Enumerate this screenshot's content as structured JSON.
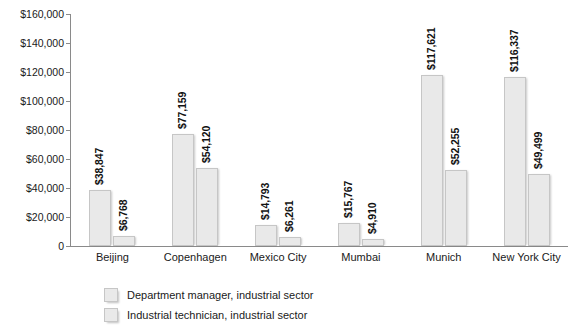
{
  "chart_data": {
    "type": "bar",
    "title": "",
    "xlabel": "",
    "ylabel": "",
    "categories": [
      "Beijing",
      "Copenhagen",
      "Mexico City",
      "Mumbai",
      "Munich",
      "New York City"
    ],
    "series": [
      {
        "name": "Department manager, industrial sector",
        "values": [
          38847,
          77159,
          14793,
          15767,
          117621,
          116337
        ],
        "labels": [
          "$38,847",
          "$77,159",
          "$14,793",
          "$15,767",
          "$117,621",
          "$116,337"
        ],
        "color": "#e9e9e9"
      },
      {
        "name": "Industrial technician, industrial sector",
        "values": [
          6768,
          54120,
          6261,
          4910,
          52255,
          49499
        ],
        "labels": [
          "$6,768",
          "$54,120",
          "$6,261",
          "$4,910",
          "$52,255",
          "$49,499"
        ],
        "color": "#e9e9e9"
      }
    ],
    "ylim": [
      0,
      160000
    ],
    "ytick_values": [
      160000,
      140000,
      120000,
      100000,
      80000,
      60000,
      40000,
      20000,
      0
    ],
    "ytick_labels": [
      "$160,000",
      "$140,000",
      "$120,000",
      "$100,000",
      "$80,000",
      "$60,000",
      "$40,000",
      "$20,000",
      "0"
    ],
    "grid": false,
    "legend_position": "bottom-left",
    "axis_color": "#8a8a8a",
    "bar_border_color": "#c6c6c6"
  },
  "legend": {
    "items": [
      {
        "label": "Department manager, industrial sector"
      },
      {
        "label": "Industrial technician, industrial sector"
      }
    ]
  }
}
